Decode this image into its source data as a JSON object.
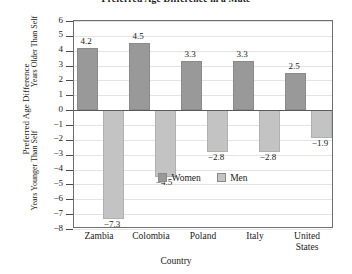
{
  "chart_data": {
    "type": "bar",
    "title": "Preferred Age Difference in a Mate",
    "xlabel": "Country",
    "ylabel": "Preferred Age Difference",
    "ylabel_positive": "Years Older Than Self",
    "ylabel_negative": "Years Younger Than Self",
    "categories": [
      "Zambia",
      "Colombia",
      "Poland",
      "Italy",
      "United States"
    ],
    "series": [
      {
        "name": "Women",
        "color": "#999999",
        "values": [
          4.2,
          4.5,
          3.3,
          3.3,
          2.5
        ]
      },
      {
        "name": "Men",
        "color": "#c3c3c3",
        "values": [
          -7.3,
          -4.5,
          -2.8,
          -2.8,
          -1.9
        ]
      }
    ],
    "ylim": [
      -8,
      6
    ],
    "yticks": [
      6,
      5,
      4,
      3,
      2,
      1,
      0,
      -1,
      -2,
      -3,
      -4,
      -5,
      -6,
      -7,
      -8
    ],
    "ytick_labels": [
      "6",
      "5",
      "4",
      "3",
      "2",
      "1",
      "0",
      "−1",
      "−2",
      "−3",
      "−4",
      "−5",
      "−6",
      "−7",
      "−8"
    ],
    "data_labels": {
      "Women": [
        "4.2",
        "4.5",
        "3.3",
        "3.3",
        "2.5"
      ],
      "Men": [
        "−7.3",
        "−4.5",
        "−2.8",
        "−2.8",
        "−1.9"
      ]
    },
    "grid": true,
    "legend_position": "inside-bottom-center",
    "category_lines": [
      [
        "Zambia"
      ],
      [
        "Colombia"
      ],
      [
        "Poland"
      ],
      [
        "Italy"
      ],
      [
        "United",
        "States"
      ]
    ]
  }
}
